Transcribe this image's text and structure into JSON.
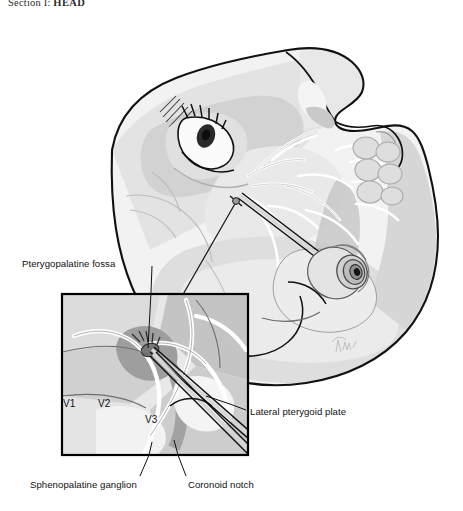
{
  "page": {
    "running_head_prefix": "Section I: ",
    "running_head_title": "HEAD",
    "background_color": "#ffffff"
  },
  "figure": {
    "name": "pterygopalatine-fossa-block-illustration",
    "style": {
      "outline_color": "#111111",
      "skin_light": "#f1f1f1",
      "skin_mid": "#dcdcdc",
      "skin_shadow": "#c4c4c4",
      "bone_light": "#e6e6e6",
      "bone_mid": "#cfcfcf",
      "bone_dark": "#a9a9a9",
      "muscle_dark": "#9b9b9b",
      "nerve_white": "#ffffff",
      "vessel_gray": "#b9b9b9",
      "needle_gray": "#d3d3d3",
      "inset_border": "#000000"
    },
    "inset": {
      "name": "magnified-inset-box",
      "x": 60,
      "y": 292,
      "width": 190,
      "height": 165,
      "border_width": 2
    },
    "signature": "artist-signature"
  },
  "labels": [
    {
      "id": "pterygopalatine-fossa",
      "text": "Pterygopalatine fossa",
      "leader": {
        "from": [
          152,
          265
        ],
        "to": [
          148,
          352
        ]
      }
    },
    {
      "id": "lateral-pterygoid-plate",
      "text": "Lateral pterygoid plate",
      "leader": {
        "from": [
          247,
          410
        ],
        "to": [
          206,
          396
        ]
      }
    },
    {
      "id": "sphenopalatine-ganglion",
      "text": "Sphenopalatine ganglion",
      "leader": {
        "from": [
          140,
          476
        ],
        "to": [
          152,
          440
        ]
      }
    },
    {
      "id": "coronoid-notch",
      "text": "Coronoid notch",
      "leader": {
        "from": [
          184,
          476
        ],
        "to": [
          174,
          440
        ]
      }
    }
  ],
  "nerve_divisions": [
    {
      "id": "v1",
      "text": "V1"
    },
    {
      "id": "v2",
      "text": "V2"
    },
    {
      "id": "v3",
      "text": "V3"
    }
  ]
}
